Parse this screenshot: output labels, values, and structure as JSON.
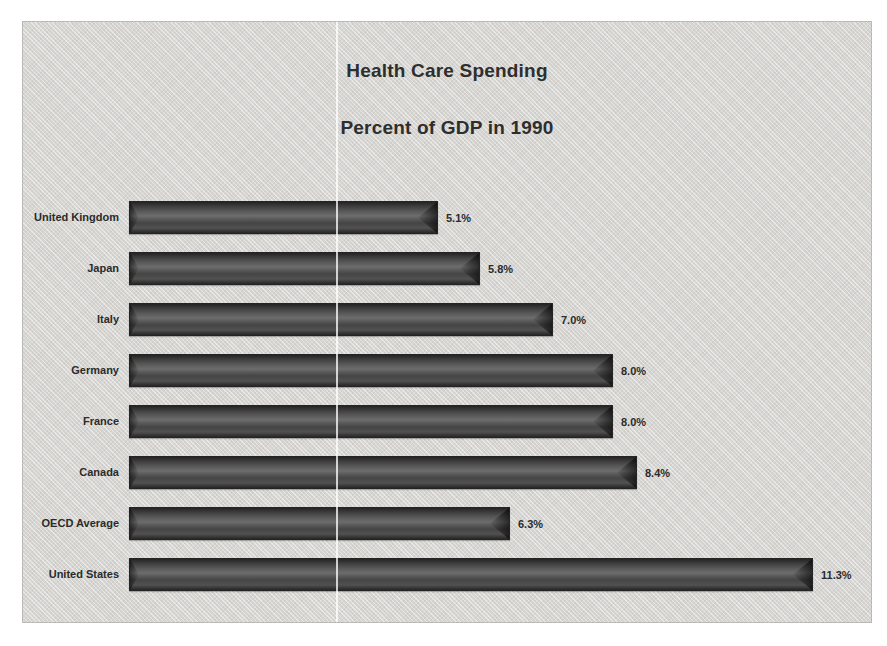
{
  "chart_data": {
    "type": "bar",
    "orientation": "horizontal",
    "title": "Health Care Spending",
    "subtitle": "Percent of GDP in 1990",
    "categories": [
      "United Kingdom",
      "Japan",
      "Italy",
      "Germany",
      "France",
      "Canada",
      "OECD Average",
      "United States"
    ],
    "values": [
      5.1,
      5.8,
      7.0,
      8.0,
      8.0,
      8.4,
      6.3,
      11.3
    ],
    "value_labels": [
      "5.1%",
      "5.8%",
      "7.0%",
      "8.0%",
      "8.4%",
      "6.3%",
      "11.3%"
    ],
    "data_labels": [
      {
        "category": "United Kingdom",
        "value": 5.1,
        "label": "5.1%"
      },
      {
        "category": "Japan",
        "value": 5.8,
        "label": "5.8%"
      },
      {
        "category": "Italy",
        "value": 7.0,
        "label": "7.0%"
      },
      {
        "category": "Germany",
        "value": 8.0,
        "label": "8.0%"
      },
      {
        "category": "France",
        "value": 8.0,
        "label": "8.0%"
      },
      {
        "category": "Canada",
        "value": 8.4,
        "label": "8.4%"
      },
      {
        "category": "OECD Average",
        "value": 6.3,
        "label": "6.3%"
      },
      {
        "category": "United States",
        "value": 11.3,
        "label": "11.3%"
      }
    ],
    "xlabel": "",
    "ylabel": "",
    "xlim": [
      0,
      12
    ],
    "grid": false,
    "legend": "none",
    "colors": {
      "bar": "#4a4a4a",
      "bar_edge": "#242424",
      "canvas_background": "#d6d5d1",
      "page_background": "#ffffff",
      "text": "#2e2e2e"
    }
  }
}
